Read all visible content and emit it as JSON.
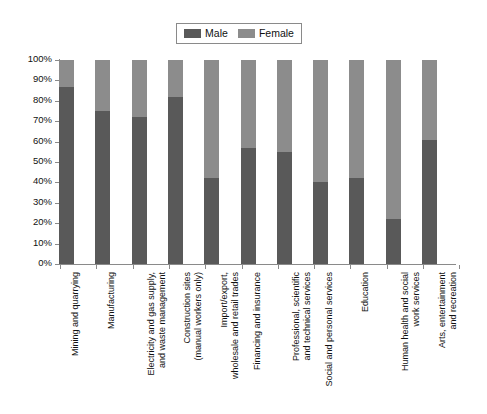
{
  "chart_data": {
    "type": "bar",
    "subtype": "stacked-percentage",
    "title": "",
    "xlabel": "",
    "ylabel": "",
    "ylim": [
      0,
      100
    ],
    "y_unit": "%",
    "grid": false,
    "legend_position": "top-center",
    "categories": [
      "Mining and quarrying",
      "Manufacturing",
      "Electricity and gas supply,\nand waste management",
      "Construction sites\n(manual workers only)",
      "Import/export,\nwholesale and retail trades",
      "Financing and insurance",
      "Professional, scientific\nand technical services",
      "Social and personal services",
      "Education",
      "Human health and social\nwork services",
      "Arts, entertainment\nand recreation"
    ],
    "series": [
      {
        "name": "Male",
        "color": "#595959",
        "values": [
          87,
          75,
          72,
          82,
          42,
          57,
          55,
          40,
          42,
          22,
          61
        ]
      },
      {
        "name": "Female",
        "color": "#8c8c8c",
        "values": [
          13,
          25,
          28,
          18,
          58,
          43,
          45,
          60,
          58,
          78,
          39
        ]
      }
    ],
    "y_ticks": [
      "0%",
      "10%",
      "20%",
      "30%",
      "40%",
      "50%",
      "60%",
      "70%",
      "80%",
      "90%",
      "100%"
    ],
    "y_tick_values": [
      0,
      10,
      20,
      30,
      40,
      50,
      60,
      70,
      80,
      90,
      100
    ]
  },
  "legend": {
    "items": [
      {
        "label": "Male",
        "color": "#595959"
      },
      {
        "label": "Female",
        "color": "#8c8c8c"
      }
    ]
  },
  "colors": {
    "male": "#595959",
    "female": "#8c8c8c",
    "axis": "#8a8a8a",
    "text": "#111111",
    "background": "#ffffff"
  }
}
